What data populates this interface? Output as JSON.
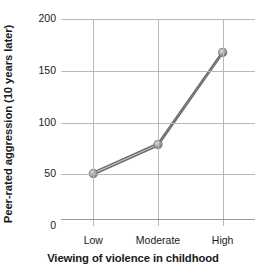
{
  "chart_data": {
    "type": "line",
    "title": "",
    "xlabel": "Viewing of violence in childhood",
    "ylabel": "Peer-rated aggression (10 years later)",
    "categories": [
      "Low",
      "Moderate",
      "High"
    ],
    "values": [
      52,
      80,
      169
    ],
    "series": [
      {
        "name": "Peer-rated aggression",
        "values": [
          52,
          80,
          169
        ]
      }
    ],
    "ylim": [
      0,
      200
    ],
    "yticks": [
      0,
      50,
      100,
      150,
      200
    ],
    "ytick_labels": [
      "0",
      "50",
      "100",
      "150",
      "200"
    ],
    "grid": true,
    "legend": "none",
    "line_color": "#6e6e6e",
    "marker_color": "#9a9a9a",
    "grid_color": "#b9b9b9",
    "axis_color": "#9a9a9a",
    "text_color": "#1a1a1a",
    "background": "#ffffff"
  }
}
